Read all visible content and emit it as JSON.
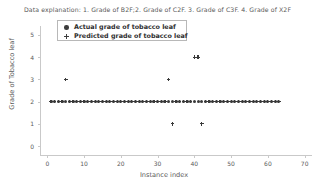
{
  "explanation": "Data explanation: 1. Grade of B2F;2. Grade of C2F. 3. Grade of C3F. 4. Grade of X2F",
  "legend": {
    "items": [
      {
        "label": "Actual grade of tobacco leaf",
        "marker": "circle-marker-icon",
        "color": "#3d3d3d"
      },
      {
        "label": "Predicted grade of tobacco leaf",
        "marker": "plus-marker-icon",
        "color": "#3d3d3d"
      }
    ]
  },
  "chart_data": {
    "type": "scatter",
    "title": "",
    "xlabel": "Instance index",
    "ylabel": "Grade of Tobacco leaf",
    "xlim": [
      -2,
      72
    ],
    "ylim": [
      -0.4,
      5.4
    ],
    "xticks": [
      0,
      10,
      20,
      30,
      40,
      50,
      60,
      70
    ],
    "yticks": [
      0,
      1,
      2,
      3,
      4,
      5
    ],
    "grid": false,
    "legend_position": "upper-left",
    "series": [
      {
        "name": "Actual grade of tobacco leaf",
        "marker": "circle",
        "color": "#3a3a3a",
        "x": [
          1,
          2,
          3,
          4,
          5,
          6,
          7,
          8,
          9,
          10,
          11,
          12,
          13,
          14,
          15,
          16,
          17,
          18,
          19,
          20,
          21,
          22,
          23,
          24,
          25,
          26,
          27,
          28,
          29,
          30,
          31,
          32,
          33,
          34,
          35,
          36,
          37,
          38,
          39,
          40,
          41,
          42,
          43,
          44,
          45,
          46,
          47,
          48,
          49,
          50,
          51,
          52,
          53,
          54,
          55,
          56,
          57,
          58,
          59,
          60,
          61,
          62,
          63
        ],
        "y": [
          2,
          2,
          2,
          2,
          2,
          2,
          2,
          2,
          2,
          2,
          2,
          2,
          2,
          2,
          2,
          2,
          2,
          2,
          2,
          2,
          2,
          2,
          2,
          2,
          2,
          2,
          2,
          2,
          2,
          2,
          2,
          2,
          2,
          2,
          2,
          2,
          2,
          2,
          2,
          2,
          2,
          2,
          2,
          2,
          2,
          2,
          2,
          2,
          2,
          2,
          2,
          2,
          2,
          2,
          2,
          2,
          2,
          2,
          2,
          2,
          2,
          2,
          2
        ]
      },
      {
        "name": "Predicted grade of tobacco leaf",
        "marker": "plus",
        "color": "#3a3a3a",
        "x": [
          1,
          2,
          3,
          4,
          5,
          6,
          7,
          8,
          9,
          10,
          11,
          12,
          13,
          14,
          15,
          16,
          17,
          18,
          19,
          20,
          21,
          22,
          23,
          24,
          25,
          26,
          27,
          28,
          29,
          30,
          31,
          32,
          33,
          34,
          35,
          36,
          37,
          38,
          39,
          40,
          41,
          42,
          43,
          44,
          45,
          46,
          47,
          48,
          49,
          50,
          51,
          52,
          53,
          54,
          55,
          56,
          57,
          58,
          59,
          60,
          61,
          62,
          63
        ],
        "y": [
          2,
          2,
          2,
          2,
          3,
          2,
          2,
          2,
          2,
          2,
          2,
          2,
          2,
          2,
          2,
          2,
          2,
          2,
          2,
          2,
          2,
          2,
          2,
          2,
          2,
          2,
          2,
          2,
          2,
          2,
          2,
          2,
          3,
          1,
          2,
          2,
          2,
          2,
          2,
          4,
          4,
          1,
          2,
          2,
          2,
          2,
          2,
          2,
          2,
          2,
          2,
          2,
          2,
          2,
          2,
          2,
          2,
          2,
          2,
          2,
          2,
          2,
          2
        ]
      }
    ]
  }
}
